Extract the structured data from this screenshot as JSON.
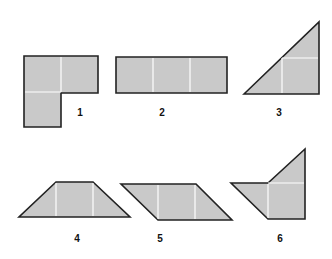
{
  "colors": {
    "fill": "#c9c9c9",
    "stroke": "#222222",
    "divider": "#ffffff",
    "background": "#ffffff"
  },
  "figures": [
    {
      "id": 1,
      "label": "1",
      "name": "L-shape"
    },
    {
      "id": 2,
      "label": "2",
      "name": "rectangle"
    },
    {
      "id": 3,
      "label": "3",
      "name": "right-triangle"
    },
    {
      "id": 4,
      "label": "4",
      "name": "trapezoid"
    },
    {
      "id": 5,
      "label": "5",
      "name": "parallelogram"
    },
    {
      "id": 6,
      "label": "6",
      "name": "pentagon"
    }
  ]
}
